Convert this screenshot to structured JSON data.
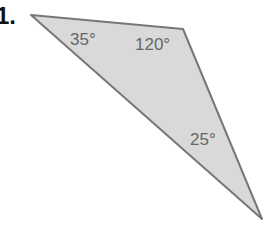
{
  "problem_number": "1.",
  "triangle": {
    "fill": "#d9d9d9",
    "stroke": "#777777",
    "angles": [
      {
        "vertex": "top-left",
        "label": "35°"
      },
      {
        "vertex": "top-right",
        "label": "120°"
      },
      {
        "vertex": "bottom-right",
        "label": "25°"
      }
    ]
  }
}
